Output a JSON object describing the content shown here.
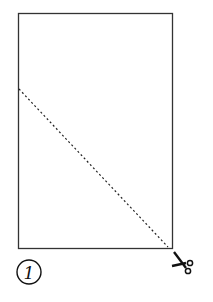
{
  "diagram": {
    "step_number": "1",
    "sheet": {
      "x": 18,
      "y": 13,
      "width": 154,
      "height": 235,
      "stroke": "#333333"
    },
    "cut_line": {
      "from": [
        18,
        89
      ],
      "to": [
        168,
        248
      ],
      "style": "dashed",
      "stroke": "#222222"
    },
    "icons": {
      "cut": "scissors-icon"
    }
  }
}
